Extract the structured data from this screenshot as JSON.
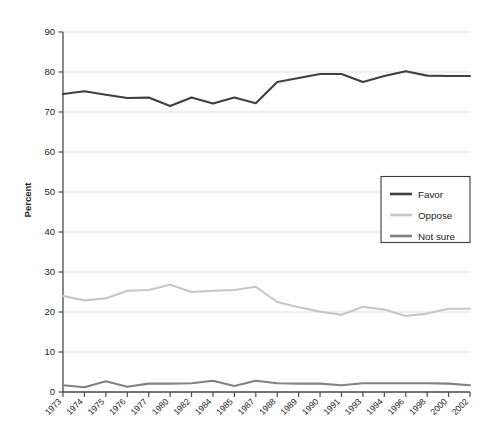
{
  "chart_data": {
    "type": "line",
    "title": "",
    "xlabel": "",
    "ylabel": "Percent",
    "ylim": [
      0,
      90
    ],
    "ytick_step": 10,
    "grid": true,
    "legend_position": "center-right",
    "categories": [
      "1973",
      "1974",
      "1975",
      "1976",
      "1977",
      "1980",
      "1982",
      "1984",
      "1985",
      "1987",
      "1988",
      "1989",
      "1990",
      "1991",
      "1993",
      "1994",
      "1996",
      "1998",
      "2000",
      "2002"
    ],
    "yticks": [
      "0",
      "10",
      "20",
      "30",
      "40",
      "50",
      "60",
      "70",
      "80",
      "90"
    ],
    "series": [
      {
        "name": "Favor",
        "color": "#3f3f3f",
        "values": [
          74.5,
          75.2,
          74.3,
          73.5,
          73.6,
          71.5,
          73.6,
          72.1,
          73.6,
          72.2,
          77.5,
          78.5,
          79.5,
          79.5,
          77.5,
          79.0,
          80.2,
          79.1,
          79.0,
          79.0
        ]
      },
      {
        "name": "Oppose",
        "color": "#c6c6c6",
        "values": [
          24.0,
          22.9,
          23.4,
          25.3,
          25.5,
          26.8,
          25.0,
          25.3,
          25.5,
          26.3,
          22.5,
          21.2,
          20.1,
          19.3,
          21.3,
          20.6,
          19.0,
          19.6,
          20.8,
          20.8
        ]
      },
      {
        "name": "Not sure",
        "color": "#818181",
        "values": [
          1.7,
          1.2,
          2.7,
          1.3,
          2.1,
          2.1,
          2.2,
          2.8,
          1.5,
          2.8,
          2.2,
          2.1,
          2.1,
          1.7,
          2.2,
          2.2,
          2.2,
          2.2,
          2.1,
          1.7
        ]
      }
    ]
  },
  "axes": {
    "y_axis_title": "Percent"
  },
  "legend": {
    "entries": [
      {
        "label": "Favor"
      },
      {
        "label": "Oppose"
      },
      {
        "label": "Not sure"
      }
    ]
  }
}
